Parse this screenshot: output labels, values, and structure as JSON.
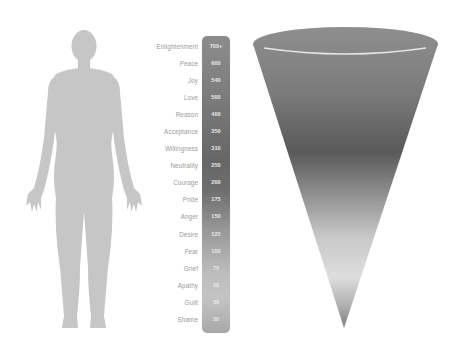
{
  "diagram": {
    "title": "",
    "figure": {
      "kind": "human-silhouette",
      "color": "#c4c4c4"
    },
    "scale": [
      {
        "label": "Enlightenment",
        "value": "700+"
      },
      {
        "label": "Peace",
        "value": "600"
      },
      {
        "label": "Joy",
        "value": "540"
      },
      {
        "label": "Love",
        "value": "500"
      },
      {
        "label": "Reason",
        "value": "400"
      },
      {
        "label": "Acceptance",
        "value": "350"
      },
      {
        "label": "Willingness",
        "value": "310"
      },
      {
        "label": "Neutrality",
        "value": "250"
      },
      {
        "label": "Courage",
        "value": "200"
      },
      {
        "label": "Pride",
        "value": "175"
      },
      {
        "label": "Anger",
        "value": "150"
      },
      {
        "label": "Desire",
        "value": "125"
      },
      {
        "label": "Fear",
        "value": "100"
      },
      {
        "label": "Grief",
        "value": "75"
      },
      {
        "label": "Apathy",
        "value": "50"
      },
      {
        "label": "Guilt",
        "value": "30"
      },
      {
        "label": "Shame",
        "value": "20"
      }
    ],
    "cone": {
      "kind": "inverted-cone",
      "gradient": [
        "#8a8a8a",
        "#5a5a5a",
        "#d8d8d8",
        "#8a8a8a"
      ]
    }
  }
}
